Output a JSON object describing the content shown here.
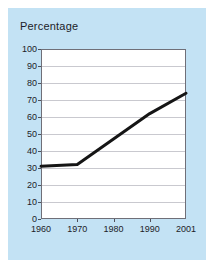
{
  "card": {
    "background_color": "#c3e2f4"
  },
  "chart_data": {
    "type": "line",
    "title": "Percentage",
    "subtitle": "",
    "xlabel": "",
    "ylabel": "",
    "categories": [
      "1960",
      "1970",
      "1980",
      "1990",
      "2001"
    ],
    "x": [
      1960,
      1970,
      1980,
      1990,
      2001
    ],
    "values": [
      31,
      32,
      47,
      62,
      74
    ],
    "series": [
      {
        "name": "Percentage",
        "values": [
          31,
          32,
          47,
          62,
          74
        ],
        "color": "#151515",
        "line_width": 3
      }
    ],
    "ylim": [
      0,
      100
    ],
    "ytick_step": 10,
    "yticks": [
      0,
      10,
      20,
      30,
      40,
      50,
      60,
      70,
      80,
      90,
      100
    ],
    "ytick_labels": [
      "0",
      "10",
      "20",
      "30",
      "40",
      "50",
      "60",
      "70",
      "80",
      "90",
      "100"
    ],
    "xticks": [
      1960,
      1970,
      1980,
      1990,
      2001
    ],
    "xtick_labels": [
      "1960",
      "1970",
      "1980",
      "1990",
      "2001"
    ],
    "grid": true,
    "grid_axis": "y",
    "grid_color": "#c9c9cf",
    "legend": false,
    "legend_position": "none",
    "plot_background": "#ffffff",
    "axis_color": "#6f6f78",
    "annotations": []
  }
}
